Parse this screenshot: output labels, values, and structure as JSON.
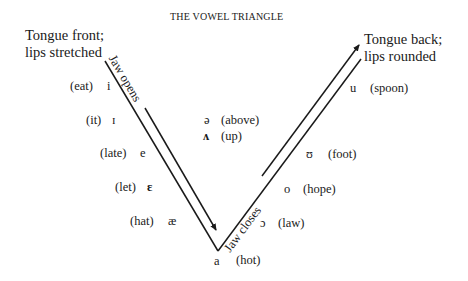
{
  "title": "THE VOWEL TRIANGLE",
  "corners": {
    "top_left": [
      "Tongue front;",
      "lips stretched"
    ],
    "top_right": [
      "Tongue back;",
      "lips rounded"
    ]
  },
  "arrows": {
    "left": "Jaw opens",
    "right": "Jaw closes"
  },
  "front_vowels": [
    {
      "example": "(eat)",
      "symbol": "i"
    },
    {
      "example": "(it)",
      "symbol": "ɪ"
    },
    {
      "example": "(late)",
      "symbol": "e"
    },
    {
      "example": "(let)",
      "symbol": "ɛ"
    },
    {
      "example": "(hat)",
      "symbol": "æ"
    }
  ],
  "central_vowels": [
    {
      "symbol": "ə",
      "example": "(above)"
    },
    {
      "symbol": "ʌ",
      "example": "(up)"
    }
  ],
  "back_vowels": [
    {
      "symbol": "u",
      "example": "(spoon)"
    },
    {
      "symbol": "ʊ",
      "example": "(foot)"
    },
    {
      "symbol": "o",
      "example": "(hope)"
    },
    {
      "symbol": "ɔ",
      "example": "(law)"
    }
  ],
  "bottom_vowel": {
    "symbol": "a",
    "example": "(hot)"
  }
}
